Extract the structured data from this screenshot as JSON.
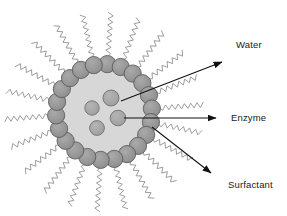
{
  "figure": {
    "type": "scientific-schematic",
    "width": 287,
    "height": 216,
    "background_color": "#ffffff"
  },
  "labels": [
    {
      "id": "water",
      "text": "Water",
      "x": 236,
      "y": 48,
      "points_to": "aqueous-core"
    },
    {
      "id": "enzyme",
      "text": "Enzyme",
      "x": 231,
      "y": 121,
      "points_to": "enzyme-particle"
    },
    {
      "id": "surfactant",
      "text": "Surfactant",
      "x": 228,
      "y": 188,
      "points_to": "surfactant-head"
    }
  ],
  "arrows": [
    {
      "id": "water-arrow",
      "x1": 121,
      "y1": 101,
      "x2": 222,
      "y2": 62,
      "label": "Water"
    },
    {
      "id": "enzyme-arrow",
      "x1": 124,
      "y1": 118,
      "x2": 216,
      "y2": 118,
      "label": "Enzyme"
    },
    {
      "id": "surfactant-arrow",
      "x1": 152,
      "y1": 127,
      "x2": 211,
      "y2": 173,
      "label": "Surfactant"
    }
  ],
  "micelle": {
    "center_x": 104,
    "center_y": 112,
    "core_radius": 42,
    "ring_radius": 48,
    "head_radius": 8.6,
    "head_count": 22,
    "tail_count": 22,
    "tail_length": 44
  },
  "enzymes": [
    {
      "id": "enzyme-1",
      "cx": 111,
      "cy": 98,
      "r": 8.0
    },
    {
      "id": "enzyme-2",
      "cx": 92,
      "cy": 108,
      "r": 7.2
    },
    {
      "id": "enzyme-3",
      "cx": 118,
      "cy": 118,
      "r": 7.8
    },
    {
      "id": "enzyme-4",
      "cx": 97,
      "cy": 128,
      "r": 7.4
    },
    {
      "id": "enzyme-5",
      "cx": 125,
      "cy": 97,
      "r": 0.0
    }
  ],
  "colors": {
    "core_fill": "#d7d7d7",
    "head_fill": "#949494",
    "head_stroke": "#5d5d5d",
    "enzyme_fill": "#a6a6a6",
    "enzyme_stroke": "#6b6b6b",
    "tail_stroke": "#8a8a8a",
    "arrow_color": "#111111",
    "text_color": "#1a1a1a",
    "background": "#ffffff"
  }
}
